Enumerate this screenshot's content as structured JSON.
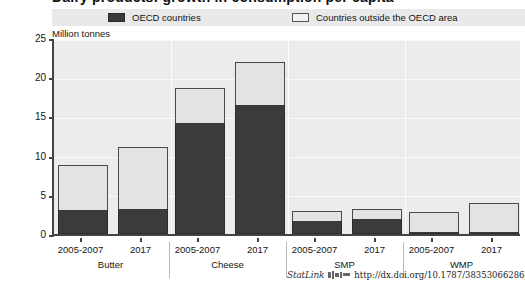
{
  "figure": {
    "title": "Dairy products: growth in consumption per capita",
    "statlink_word": "StatLink",
    "statlink_url": "http://dx.doi.org/10.1787/383530662862"
  },
  "legend": {
    "position": "top",
    "entries": [
      {
        "label": "OECD countries",
        "color": "#3b3b3b"
      },
      {
        "label": "Countries outside the OECD area",
        "color": "#e3e3e3"
      }
    ]
  },
  "chart_data": {
    "type": "bar",
    "stacked": true,
    "title": "Dairy products: growth in consumption per capita",
    "xlabel": "",
    "ylabel": "Million tonnes",
    "ylim": [
      0,
      25
    ],
    "ytick_step": 5,
    "yticks": [
      "0",
      "5",
      "10",
      "15",
      "20",
      "25"
    ],
    "grid": true,
    "groups": [
      "Butter",
      "Cheese",
      "SMP",
      "WMP"
    ],
    "periods": [
      "2005-2007",
      "2017"
    ],
    "categories": [
      "Butter 2005-2007",
      "Butter 2017",
      "Cheese 2005-2007",
      "Cheese 2017",
      "SMP 2005-2007",
      "SMP 2017",
      "WMP 2005-2007",
      "WMP 2017"
    ],
    "series": [
      {
        "name": "OECD countries",
        "color": "#3b3b3b",
        "values": [
          3.0,
          3.2,
          14.2,
          16.4,
          1.7,
          1.9,
          0.3,
          0.3
        ]
      },
      {
        "name": "Countries outside the OECD area",
        "color": "#e3e3e3",
        "values": [
          5.8,
          7.9,
          4.4,
          5.6,
          1.2,
          1.3,
          2.5,
          3.7
        ]
      }
    ],
    "totals": [
      8.8,
      11.1,
      18.6,
      22.0,
      2.9,
      3.2,
      2.8,
      4.0
    ]
  }
}
